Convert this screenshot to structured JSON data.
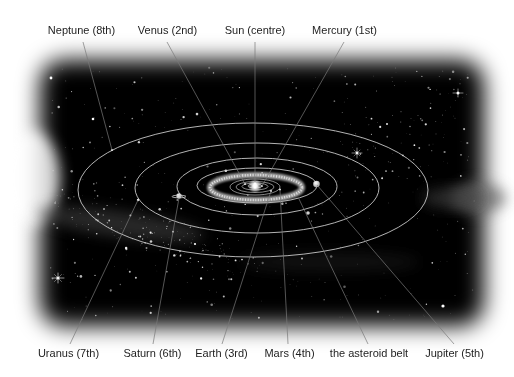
{
  "diagram": {
    "labels_top": [
      {
        "id": "neptune",
        "text": "Neptune (8th)"
      },
      {
        "id": "venus",
        "text": "Venus (2nd)"
      },
      {
        "id": "sun",
        "text": "Sun (centre)"
      },
      {
        "id": "mercury",
        "text": "Mercury (1st)"
      }
    ],
    "labels_bottom": [
      {
        "id": "uranus",
        "text": "Uranus (7th)"
      },
      {
        "id": "saturn",
        "text": "Saturn (6th)"
      },
      {
        "id": "earth",
        "text": "Earth (3rd)"
      },
      {
        "id": "mars",
        "text": "Mars (4th)"
      },
      {
        "id": "asteroid_belt",
        "text": "the asteroid belt"
      },
      {
        "id": "jupiter",
        "text": "Jupiter (5th)"
      }
    ]
  },
  "colors": {
    "page_background": "#ffffff",
    "space": "#000000",
    "orbit_stroke": "#d2d2d2",
    "leader_line": "#7a7a7a",
    "label_text": "#1e1e1e"
  }
}
